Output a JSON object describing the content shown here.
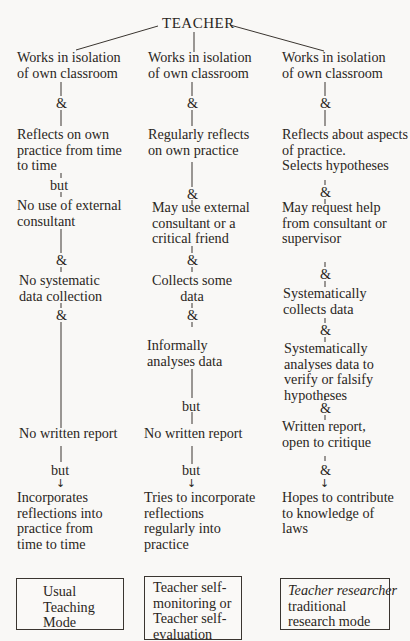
{
  "root": {
    "label": "TEACHER"
  },
  "columns": [
    {
      "steps": [
        "Works in isolation\nof own classroom",
        "Reflects on own\npractice from time\nto time",
        "No use of external\nconsultant",
        "No systematic\ndata collection",
        "No written report",
        "Incorporates\nreflections into\npractice from\ntime to time"
      ],
      "connectors": [
        "&",
        "but",
        "&",
        "&",
        "but"
      ],
      "mode_box": {
        "text": "Usual\nTeaching\nMode"
      }
    },
    {
      "steps": [
        "Works in isolation\nof own classroom",
        "Regularly reflects\non own practice",
        "May use external\nconsultant or a\ncritical friend",
        "Collects some\ndata",
        "Informally\nanalyses data",
        "No written report",
        "Tries to incorporate\nreflections\nregularly into\npractice"
      ],
      "connectors": [
        "&",
        "&",
        "&",
        "&",
        "but",
        "but"
      ],
      "mode_box": {
        "text": "Teacher self-\nmonitoring or\nTeacher self-\nevaluation"
      }
    },
    {
      "steps": [
        "Works in isolation\nof own classroom",
        "Reflects about aspects\nof practice.\nSelects hypotheses",
        "May request help\nfrom consultant or\nsupervisor",
        "Systematically\ncollects data",
        "Systematically\nanalyses data to\nverify or falsify\nhypotheses",
        "Written report,\nopen to critique",
        "Hopes to contribute\nto knowledge of\nlaws"
      ],
      "connectors": [
        "&",
        "&",
        "&",
        "&",
        "&",
        "&"
      ],
      "mode_box": {
        "text_italic": "Teacher researcher",
        "text": "traditional\nresearch mode"
      }
    }
  ],
  "icons": {
    "arrow": "↓"
  }
}
